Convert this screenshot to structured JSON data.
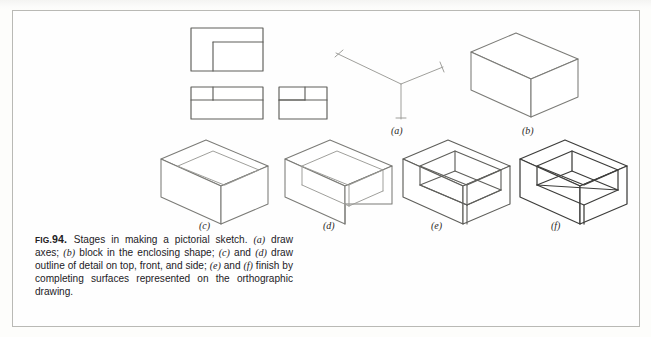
{
  "figure": {
    "number": "FIG. 94.",
    "fig_prefix": "FIG.",
    "fig_number": "94.",
    "caption_text": "Stages in making a pictorial sketch. (a) draw axes; (b) block in the enclosing shape; (c) and (d) draw outline of detail on top, front, and side; (e) and (f) finish by completing surfaces represented on the orthographic drawing.",
    "caption_segments": [
      {
        "type": "text",
        "value": "Stages in making a pictorial sketch. "
      },
      {
        "type": "italic",
        "value": "(a)"
      },
      {
        "type": "text",
        "value": " draw axes; "
      },
      {
        "type": "italic",
        "value": "(b)"
      },
      {
        "type": "text",
        "value": " block in the enclosing shape; "
      },
      {
        "type": "italic",
        "value": "(c)"
      },
      {
        "type": "text",
        "value": " and "
      },
      {
        "type": "italic",
        "value": "(d)"
      },
      {
        "type": "text",
        "value": " draw outline of detail on top, front, and side; "
      },
      {
        "type": "italic",
        "value": "(e)"
      },
      {
        "type": "text",
        "value": " and "
      },
      {
        "type": "italic",
        "value": "(f)"
      },
      {
        "type": "text",
        "value": " finish by completing surfaces represented on the orthographic drawing."
      }
    ]
  },
  "labels": {
    "a": "(a)",
    "b": "(b)",
    "c": "(c)",
    "d": "(d)",
    "e": "(e)",
    "f": "(f)"
  },
  "panels": [
    {
      "id": "orthographic-views",
      "name": "orthographic-drawing",
      "label": "",
      "description": "Three orthographic views: top view (L-shaped outline), front view, and right side view",
      "views": [
        "top-view",
        "front-view",
        "side-view"
      ]
    },
    {
      "id": "a",
      "name": "axes-sketch",
      "label": "(a)",
      "description": "draw axes"
    },
    {
      "id": "b",
      "name": "enclosing-block",
      "label": "(b)",
      "description": "block in the enclosing shape"
    },
    {
      "id": "c",
      "name": "detail-outline-top",
      "label": "(c)",
      "description": "draw outline of detail on top"
    },
    {
      "id": "d",
      "name": "detail-outline-front-side",
      "label": "(d)",
      "description": "draw outline of detail on front and side"
    },
    {
      "id": "e",
      "name": "surfaces-partial",
      "label": "(e)",
      "description": "finish by completing surfaces"
    },
    {
      "id": "f",
      "name": "finished-pictorial",
      "label": "(f)",
      "description": "completed pictorial sketch"
    }
  ],
  "colors": {
    "page_background": "#fdfdfb",
    "frame_border": "#b9b9b5",
    "line_light": "#8d8d89",
    "line_medium": "#6e6e6a",
    "line_dark": "#3a3a38",
    "text": "#23211f"
  }
}
